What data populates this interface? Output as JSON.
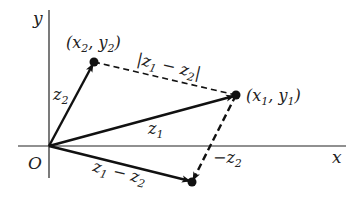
{
  "diagram": {
    "axes": {
      "x_label": "x",
      "y_label": "y",
      "origin_label": "O"
    },
    "points": {
      "p1": {
        "label_main_1": "(x",
        "sub_1": "1",
        "label_main_2": ", y",
        "sub_2": "1",
        "label_end": ")"
      },
      "p2": {
        "label_main_1": "(x",
        "sub_1": "2",
        "label_main_2": ", y",
        "sub_2": "2",
        "label_end": ")"
      }
    },
    "vectors": {
      "z1": {
        "main": "z",
        "sub": "1"
      },
      "z2": {
        "main": "z",
        "sub": "2"
      },
      "diff": {
        "main1": "z",
        "sub1": "1",
        "op": " − ",
        "main2": "z",
        "sub2": "2"
      },
      "neg_z2": {
        "prefix": "−",
        "main": "z",
        "sub": "2"
      },
      "distance": {
        "bar_l": "|",
        "main1": "z",
        "sub1": "1",
        "op": " − ",
        "main2": "z",
        "sub2": "2",
        "bar_r": "|"
      }
    },
    "colors": {
      "ink": "#111111",
      "background": "#ffffff"
    }
  }
}
